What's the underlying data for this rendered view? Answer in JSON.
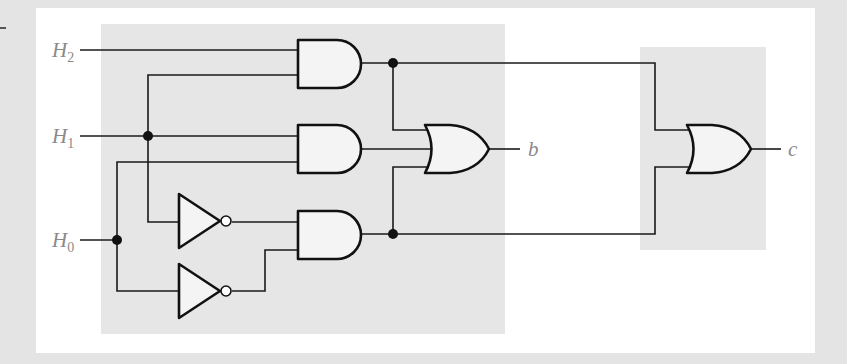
{
  "diagram": {
    "colors": {
      "background": "#e4e4e4",
      "panel": "#ffffff",
      "highlight_region": "#e6e6e6",
      "gate_fill": "#f4f4f4",
      "wire": "#1a1a1a",
      "label": "#8a8a8a"
    },
    "inputs": [
      {
        "id": "H2",
        "base": "H",
        "sub": "2"
      },
      {
        "id": "H1",
        "base": "H",
        "sub": "1"
      },
      {
        "id": "H0",
        "base": "H",
        "sub": "0"
      }
    ],
    "outputs": [
      {
        "id": "b",
        "label": "b"
      },
      {
        "id": "c",
        "label": "c"
      }
    ],
    "gates": [
      {
        "id": "and1",
        "type": "AND",
        "inputs": [
          "H2",
          "H1"
        ]
      },
      {
        "id": "and2",
        "type": "AND",
        "inputs": [
          "H1",
          "H0"
        ]
      },
      {
        "id": "not1",
        "type": "NOT",
        "inputs": [
          "H1"
        ]
      },
      {
        "id": "not2",
        "type": "NOT",
        "inputs": [
          "H0"
        ]
      },
      {
        "id": "and3",
        "type": "AND",
        "inputs": [
          "not1",
          "not2"
        ]
      },
      {
        "id": "or_b",
        "type": "OR",
        "inputs": [
          "and1",
          "and2",
          "and3"
        ],
        "output": "b"
      },
      {
        "id": "or_c",
        "type": "OR",
        "inputs": [
          "and1",
          "and3"
        ],
        "output": "c"
      }
    ]
  }
}
